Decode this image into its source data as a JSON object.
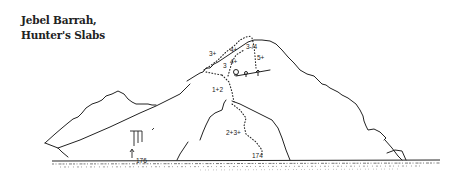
{
  "title": {
    "line1": "Jebel Barrah,",
    "line2": "Hunter's Slabs"
  },
  "topo": {
    "grades": {
      "g1": "3+",
      "g2": "4+",
      "g3": "3-/4",
      "g4": "4+",
      "g5": "5+",
      "g6": "3",
      "g7": "1+2",
      "g8": "2+3+",
      "g9": "174",
      "g10": "176"
    },
    "colors": {
      "ink": "#222222"
    }
  }
}
